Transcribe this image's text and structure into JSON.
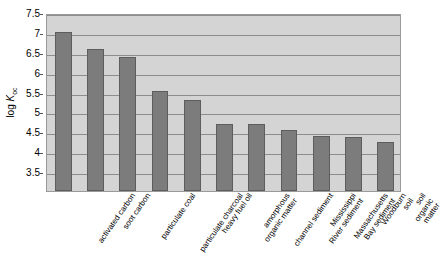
{
  "chart_data": {
    "type": "bar",
    "title": "",
    "subtitle": "",
    "xlabel": "",
    "ylabel": "log Koc",
    "ylabel_parts": {
      "prefix": "log ",
      "symbol": "K",
      "subscript": "oc"
    },
    "ylim": [
      3.5,
      7.5
    ],
    "ytick_interval": 0.5,
    "yticks": [
      "7.5",
      "7",
      "6.5",
      "6",
      "5.5",
      "5",
      "4.5",
      "4",
      "3.5"
    ],
    "ytick_values": [
      7.5,
      7,
      6.5,
      6,
      5.5,
      5,
      4.5,
      4,
      3.5
    ],
    "grid": true,
    "grid_axis": "y",
    "legend": "none",
    "categories": [
      "activated carbon",
      "soot carbon",
      "particulate coal",
      "particulate charcoal",
      "heavy fuel oil",
      "amorphous\norganic matter",
      "channel sediment",
      "Mississippi\nRiver sediment",
      "Massachusetts\nBay sediment",
      "Woodburn soil",
      "soil organic matter"
    ],
    "values": [
      7.02,
      6.6,
      6.4,
      5.55,
      5.3,
      4.72,
      4.72,
      4.55,
      4.4,
      4.38,
      4.25
    ],
    "bar_color": "#7c7c7c",
    "bar_edge_color": "#5d5d5d",
    "plot_background": "#d4d4d4",
    "grid_color": "#8d8d8d",
    "axis_color": "#9a9a9a",
    "page_background": "#ffffff"
  }
}
